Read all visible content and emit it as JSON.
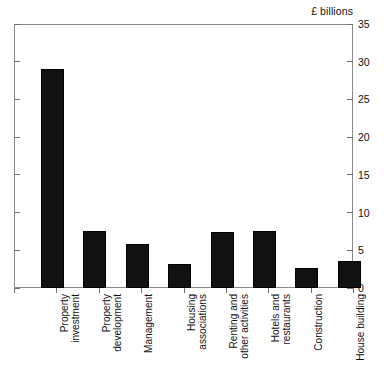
{
  "chart_data": {
    "type": "bar",
    "title": "£ billions",
    "xlabel": "",
    "ylabel": "£ billions",
    "ylim": [
      0,
      35
    ],
    "yticks": [
      0,
      5,
      10,
      15,
      20,
      25,
      30,
      35
    ],
    "ytick_labels": [
      "0",
      "5",
      "10",
      "15",
      "20",
      "25",
      "30",
      "35"
    ],
    "grid": false,
    "legend": false,
    "legend_position": "none",
    "axis_label_rotation": 90,
    "bar_color": "#111111",
    "frame_color": "#8a8a8a",
    "categories": [
      "Property investment",
      "Property development",
      "Management",
      "Housing associations",
      "Renting and other activities",
      "Hotels and restaurants",
      "Construction",
      "House building"
    ],
    "category_lines": [
      "Property\ninvestment",
      "Property\ndevelopment",
      "Management",
      "Housing\nassociations",
      "Renting and\nother activities",
      "Hotels and\nrestaurants",
      "Construction",
      "House building"
    ],
    "values": [
      29.0,
      7.6,
      5.9,
      3.2,
      7.4,
      7.6,
      2.7,
      3.6
    ]
  }
}
